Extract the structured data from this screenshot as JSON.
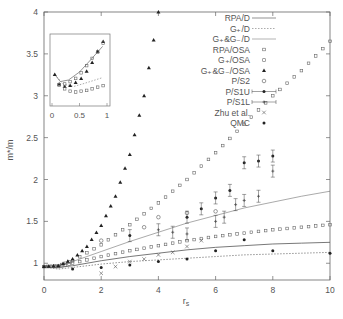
{
  "chart_data": {
    "type": "scatter",
    "title": "",
    "xlabel": "r_s",
    "ylabel": "m*/m",
    "xlim": [
      0,
      10
    ],
    "ylim": [
      0.8,
      4
    ],
    "xticks": [
      0,
      2,
      4,
      6,
      8,
      10
    ],
    "yticks": [
      1,
      1.5,
      2,
      2.5,
      3,
      3.5,
      4
    ],
    "grid": false,
    "legend_position": "upper right",
    "series": [
      {
        "name": "RPA/D",
        "style": "solid-line",
        "x": [
          0,
          0.5,
          1,
          2,
          3,
          4,
          5,
          6,
          7,
          8,
          9,
          10
        ],
        "y": [
          0.96,
          0.95,
          0.97,
          1.03,
          1.08,
          1.12,
          1.16,
          1.19,
          1.21,
          1.23,
          1.24,
          1.25
        ]
      },
      {
        "name": "G+/D",
        "style": "dotted-line",
        "x": [
          0,
          0.5,
          1,
          2,
          3,
          4,
          5,
          6,
          7,
          8,
          9,
          10
        ],
        "y": [
          0.96,
          0.93,
          0.95,
          0.99,
          1.02,
          1.04,
          1.06,
          1.08,
          1.1,
          1.11,
          1.12,
          1.13
        ]
      },
      {
        "name": "G+&G-/D",
        "style": "thin-line",
        "x": [
          0,
          0.5,
          1,
          2,
          3,
          4,
          5,
          6,
          7,
          8,
          9,
          10
        ],
        "y": [
          0.96,
          0.97,
          1.02,
          1.14,
          1.26,
          1.37,
          1.48,
          1.57,
          1.66,
          1.73,
          1.8,
          1.86
        ]
      },
      {
        "name": "RPA/OSA",
        "style": "open-square",
        "x": [
          0,
          0.5,
          1,
          2,
          3,
          4,
          5,
          6,
          7,
          8,
          9,
          10
        ],
        "y": [
          0.96,
          0.96,
          1.0,
          1.08,
          1.15,
          1.21,
          1.27,
          1.32,
          1.36,
          1.4,
          1.43,
          1.46
        ]
      },
      {
        "name": "G+/OSA",
        "style": "open-square-small",
        "x": [
          0,
          0.5,
          1,
          2,
          3,
          4,
          5,
          6,
          7,
          8,
          9,
          10
        ],
        "y": [
          0.96,
          0.97,
          1.03,
          1.22,
          1.46,
          1.72,
          2.0,
          2.32,
          2.66,
          3.0,
          3.3,
          3.65
        ]
      },
      {
        "name": "G+&G-/OSA",
        "style": "filled-triangle",
        "x": [
          0,
          0.5,
          1,
          1.5,
          2,
          2.5,
          3,
          3.5,
          4
        ],
        "y": [
          0.96,
          0.97,
          1.05,
          1.2,
          1.45,
          1.8,
          2.3,
          3.0,
          4.0
        ]
      },
      {
        "name": "P/S2",
        "style": "open-circle",
        "x": [
          2,
          3.5,
          4,
          5,
          6
        ],
        "y": [
          1.27,
          1.43,
          1.55,
          1.6,
          1.62
        ]
      },
      {
        "name": "P/S1U",
        "style": "filled-circle-errorbar",
        "x": [
          3,
          5,
          5.5,
          6,
          6.5,
          7,
          7.5,
          8
        ],
        "y": [
          1.33,
          1.55,
          1.65,
          1.78,
          1.87,
          2.2,
          2.22,
          2.28
        ]
      },
      {
        "name": "P/S1L",
        "style": "plus-errorbar",
        "x": [
          4,
          4.5,
          5,
          6,
          6.3,
          6.7,
          7,
          7.5,
          8
        ],
        "y": [
          1.4,
          1.37,
          1.35,
          1.5,
          1.55,
          1.7,
          1.75,
          1.8,
          2.1
        ]
      },
      {
        "name": "Zhu et al.",
        "style": "cross",
        "x": [
          2,
          2.5,
          3,
          3.5,
          4,
          4.5,
          5,
          5.5
        ],
        "y": [
          0.88,
          0.96,
          1.02,
          1.05,
          1.1,
          1.13,
          1.2,
          1.27
        ]
      },
      {
        "name": "QMC",
        "style": "filled-circle",
        "x": [
          1,
          2,
          3,
          4,
          5,
          6,
          7,
          8,
          10
        ],
        "y": [
          0.93,
          0.95,
          0.98,
          1.02,
          1.05,
          1.15,
          1.28,
          1.15,
          1.12
        ]
      }
    ],
    "inset": {
      "xlim": [
        0,
        1
      ],
      "ylim": [
        2.9,
        3.75
      ],
      "xticks": [
        0,
        0.5,
        1
      ],
      "yticks_shared": [
        3,
        3.5
      ]
    }
  },
  "legend": {
    "entries": [
      "RPA/D",
      "G+/D",
      "G+&G-/D",
      "RPA/OSA",
      "G+/OSA",
      "G+&G-/OSA",
      "P/S2",
      "P/S1U",
      "P/S1L",
      "Zhu et al.",
      "QMC"
    ]
  },
  "axes": {
    "xlabel": "r",
    "xlabel_sub": "s",
    "ylabel": "m*/m",
    "xtick_labels": [
      "0",
      "2",
      "4",
      "6",
      "8",
      "10"
    ],
    "ytick_labels": [
      "1",
      "1.5",
      "2",
      "2.5",
      "3",
      "3.5",
      "4"
    ],
    "inset_xtick_labels": [
      "0",
      "0.5",
      "1"
    ]
  }
}
